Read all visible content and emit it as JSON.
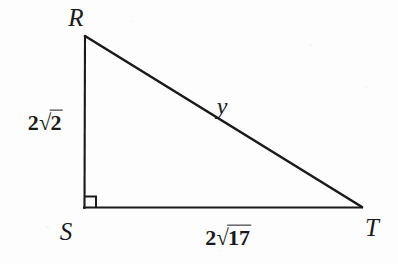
{
  "figure": {
    "type": "right-triangle-diagram",
    "background_color": "#fdfdfd",
    "stroke_color": "#1a1a1a",
    "vertices": {
      "R": {
        "label": "R",
        "x": 85,
        "y": 36,
        "label_x": 76,
        "label_y": 17
      },
      "S": {
        "label": "S",
        "x": 84,
        "y": 208,
        "label_x": 66,
        "label_y": 231
      },
      "T": {
        "label": "T",
        "x": 362,
        "y": 207,
        "label_x": 372,
        "label_y": 227
      }
    },
    "right_angle": {
      "at_vertex": "S",
      "marker_size": 11,
      "name": "right-angle-marker"
    },
    "sides": {
      "leg_vertical": {
        "name": "side-RS",
        "from": "R",
        "to": "S",
        "label_coefficient": "2",
        "label_radicand": "2",
        "label_x": 45,
        "label_y": 122
      },
      "leg_horizontal": {
        "name": "side-ST",
        "from": "S",
        "to": "T",
        "label_coefficient": "2",
        "label_radicand": "17",
        "label_x": 228,
        "label_y": 237
      },
      "hypotenuse": {
        "name": "side-RT",
        "from": "R",
        "to": "T",
        "label": "y",
        "label_x": 222,
        "label_y": 106
      }
    },
    "surd_glyph": "√"
  }
}
